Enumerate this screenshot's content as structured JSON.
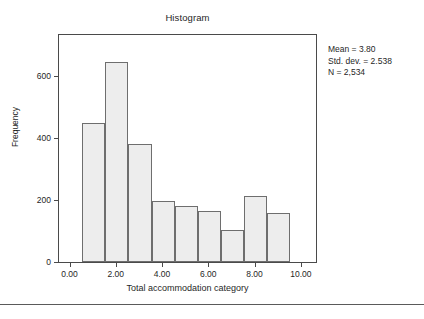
{
  "chart_data": {
    "type": "bar",
    "title": "Histogram",
    "xlabel": "Total accommodation category",
    "ylabel": "Frequency",
    "grid": false,
    "legend": null,
    "xlim": [
      -0.5,
      10.7
    ],
    "ylim": [
      0,
      740
    ],
    "bin_width": 1,
    "x_ticks": [
      "0.00",
      "2.00",
      "4.00",
      "6.00",
      "8.00",
      "10.00"
    ],
    "x_tick_values": [
      0,
      2,
      4,
      6,
      8,
      10
    ],
    "y_ticks": [
      "0",
      "200",
      "400",
      "600"
    ],
    "y_tick_values": [
      0,
      200,
      400,
      600
    ],
    "bin_centers": [
      1,
      2,
      3,
      4,
      5,
      6,
      7,
      8,
      9
    ],
    "bin_starts": [
      0.5,
      1.5,
      2.5,
      3.5,
      4.5,
      5.5,
      6.5,
      7.5,
      8.5
    ],
    "bin_ends": [
      1.5,
      2.5,
      3.5,
      4.5,
      5.5,
      6.5,
      7.5,
      8.5,
      9.5
    ],
    "values": [
      449,
      645,
      382,
      196,
      182,
      166,
      102,
      212,
      157
    ],
    "bar_fill": "#ededed",
    "bar_border": "#6e6e6e",
    "annotations": [
      "Mean = 3.80",
      "Std. dev. = 2.538",
      "N = 2,534"
    ]
  },
  "stats": {
    "mean_line": "Mean = 3.80",
    "stddev_line": "Std. dev. = 2.538",
    "n_line": "N = 2,534"
  }
}
